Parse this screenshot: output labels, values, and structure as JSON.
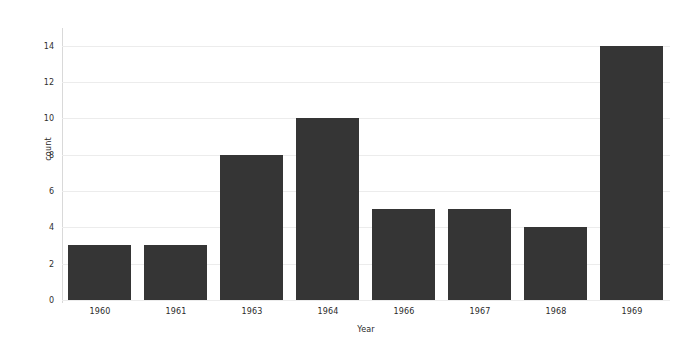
{
  "chart_data": {
    "type": "bar",
    "title": "",
    "subtitle": "",
    "xlabel": "Year",
    "ylabel": "count",
    "categories": [
      "1960",
      "1961",
      "1963",
      "1964",
      "1966",
      "1967",
      "1968",
      "1969"
    ],
    "values": [
      3,
      3,
      8,
      10,
      5,
      5,
      4,
      14
    ],
    "series": [
      {
        "name": "count",
        "values": [
          3,
          3,
          8,
          10,
          5,
          5,
          4,
          14
        ]
      }
    ],
    "ylim": [
      0,
      14.8
    ],
    "xlim": [
      0,
      8
    ],
    "yticks": [
      0,
      2,
      4,
      6,
      8,
      10,
      12,
      14
    ],
    "ytick_labels": [
      "0",
      "2",
      "4",
      "6",
      "8",
      "10",
      "12",
      "14"
    ],
    "xtick_labels": [
      "1960",
      "1961",
      "1963",
      "1964",
      "1966",
      "1967",
      "1968",
      "1969"
    ],
    "grid": "horizontal",
    "legend": "none",
    "annotations": [],
    "colors": {
      "bar": "#353535",
      "background": "#ffffff",
      "gridline": "#ececec",
      "axis": "#d9d9d9",
      "text": "#2a2a2a"
    }
  }
}
